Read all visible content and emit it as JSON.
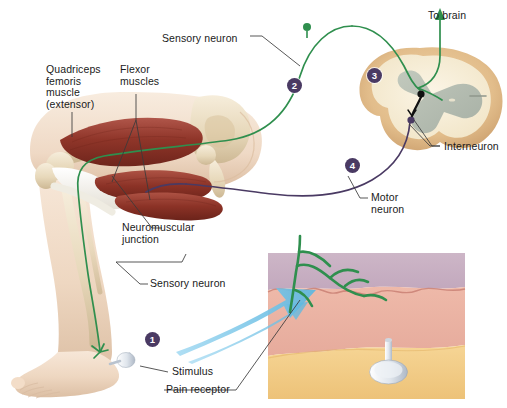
{
  "figure": {
    "colors": {
      "sensory_neuron": "#2f8f4e",
      "motor_neuron": "#4a3a63",
      "badge": "#4a3a63",
      "leader_line": "#3a3a3a",
      "magnify_arrow": "#7fc8ec",
      "skin_epidermis": "#c9b3c4",
      "skin_dermis": "#eab3a4",
      "skin_fat": "#f2ca7e",
      "cord_outer": "#e2bd8b",
      "cord_inner": "#f6edd6",
      "gray_matter": "#b3bcb0",
      "muscle": "#9e3f35",
      "bone": "#e8dcc0",
      "flesh": "#f0d9c4"
    }
  },
  "labels": [
    {
      "id": "quadriceps",
      "text": "Quadriceps\nfemoris\nmuscle\n(extensor)",
      "x": 46,
      "y": 64,
      "align": "left"
    },
    {
      "id": "flexor",
      "text": "Flexor\nmuscles",
      "x": 120,
      "y": 64,
      "align": "left"
    },
    {
      "id": "sensory-top",
      "text": "Sensory neuron",
      "x": 162,
      "y": 39,
      "align": "left"
    },
    {
      "id": "to-brain",
      "text": "To brain",
      "x": 428,
      "y": 10,
      "align": "left"
    },
    {
      "id": "interneuron",
      "text": "Interneuron",
      "x": 441,
      "y": 148,
      "align": "left"
    },
    {
      "id": "motor",
      "text": "Motor\nneuron",
      "x": 371,
      "y": 197,
      "align": "left"
    },
    {
      "id": "nmj",
      "text": "Neuromuscular\njunction",
      "x": 122,
      "y": 230,
      "align": "left"
    },
    {
      "id": "sensory-bot",
      "text": "Sensory neuron",
      "x": 150,
      "y": 278,
      "align": "left"
    },
    {
      "id": "stimulus",
      "text": "Stimulus",
      "x": 172,
      "y": 369,
      "align": "left"
    },
    {
      "id": "pain",
      "text": "Pain receptor",
      "x": 168,
      "y": 388,
      "align": "left"
    }
  ],
  "step_badges": [
    {
      "id": "step-1",
      "number": "1",
      "x": 145,
      "y": 332
    },
    {
      "id": "step-2",
      "number": "2",
      "x": 287,
      "y": 78
    },
    {
      "id": "step-3",
      "number": "3",
      "x": 367,
      "y": 68
    },
    {
      "id": "step-4",
      "number": "4",
      "x": 345,
      "y": 158
    }
  ],
  "structures": [
    {
      "id": "leg",
      "name": "flexed-leg-with-muscles-and-bones"
    },
    {
      "id": "spinal-cord",
      "name": "spinal-cord-cross-section"
    },
    {
      "id": "skin-inset",
      "name": "skin-cross-section-inset"
    },
    {
      "id": "thumbtack",
      "name": "thumbtack-stimulus"
    },
    {
      "id": "magnifier",
      "name": "magnification-arrow"
    }
  ]
}
